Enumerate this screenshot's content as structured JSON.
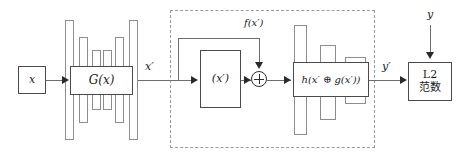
{
  "diagram": {
    "colors": {
      "background": "#ffffff",
      "box_stroke": "#4a4a4a",
      "bar_stroke": "#8d8d8d",
      "line_stroke": "#6e6e6e",
      "arrow_fill": "#2a2a2a",
      "dashed_stroke": "#9a9a9a",
      "text": "#1a1a1a"
    },
    "nodes": {
      "input_x": {
        "label": "x",
        "x": 18,
        "y": 66,
        "w": 28,
        "h": 28
      },
      "generator": {
        "label": "G(x)",
        "x": 70,
        "y": 66,
        "w": 63,
        "h": 29
      },
      "feature": {
        "label": "(x′)",
        "x": 200,
        "y": 50,
        "w": 41,
        "h": 58
      },
      "sum_operator": {
        "label": "⊕",
        "cx": 259,
        "cy": 79,
        "r": 8
      },
      "reconstructor": {
        "label": "h(x′ ⊕ g(x′))",
        "x": 293,
        "y": 62,
        "w": 76,
        "h": 35
      },
      "l2_norm": {
        "line1": "L2",
        "line2": "范数",
        "x": 408,
        "y": 62,
        "w": 44,
        "h": 39
      }
    },
    "edge_labels": {
      "x_prime": "x′",
      "f_x_prime": "f(x′)",
      "y_prime": "y′",
      "y_target": "y"
    },
    "dashed_module": {
      "x": 170,
      "y": 10,
      "w": 205,
      "h": 138
    },
    "generator_bars": [
      {
        "name": "tall-left",
        "x": 65,
        "y": 20,
        "w": 9,
        "h": 120
      },
      {
        "name": "tall-right",
        "x": 129,
        "y": 20,
        "w": 9,
        "h": 120
      },
      {
        "name": "mid-left",
        "x": 79,
        "y": 37,
        "w": 9,
        "h": 86
      },
      {
        "name": "mid-right",
        "x": 115,
        "y": 37,
        "w": 9,
        "h": 86
      },
      {
        "name": "short-left",
        "x": 92,
        "y": 50,
        "w": 9,
        "h": 60
      },
      {
        "name": "short-right",
        "x": 103,
        "y": 50,
        "w": 9,
        "h": 60
      }
    ],
    "reconstructor_bars": [
      {
        "name": "tall-left",
        "x": 294,
        "y": 25,
        "w": 13,
        "h": 110
      },
      {
        "name": "mid-mid",
        "x": 320,
        "y": 45,
        "w": 16,
        "h": 75
      },
      {
        "name": "short-right",
        "x": 345,
        "y": 57,
        "w": 21,
        "h": 47
      }
    ]
  }
}
